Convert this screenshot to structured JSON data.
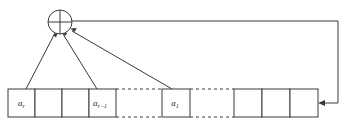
{
  "diagram": {
    "type": "lfsr-schematic",
    "colors": {
      "stroke": "#3a3a3a",
      "fill": "#ffffff",
      "text": "#2a2a2a",
      "background": "#ffffff"
    },
    "xor_gate": {
      "name": "xor-gate",
      "symbol": "⊕",
      "label": "",
      "cx": 60,
      "cy": 22,
      "r": 12,
      "input_count": 3
    },
    "register": {
      "name": "shift-register",
      "top": 89,
      "bottom": 117,
      "left_group": {
        "name": "left-cell-group",
        "x": 8,
        "width": 108,
        "cell_count": 4,
        "cells": [
          {
            "name": "cell-a-r",
            "label_base": "a",
            "label_sub": "r",
            "x": 8,
            "w": 27,
            "has_tap": true
          },
          {
            "name": "cell-blank-1",
            "label_base": "",
            "label_sub": "",
            "x": 35,
            "w": 27,
            "has_tap": false
          },
          {
            "name": "cell-blank-2",
            "label_base": "",
            "label_sub": "",
            "x": 62,
            "w": 27,
            "has_tap": false
          },
          {
            "name": "cell-a-r-minus-1",
            "label_base": "a",
            "label_sub": "r−1",
            "x": 89,
            "w": 27,
            "has_tap": true
          }
        ]
      },
      "middle_group": {
        "name": "middle-cell-group",
        "x": 162,
        "width": 28,
        "cell_count": 1,
        "cells": [
          {
            "name": "cell-a-1",
            "label_base": "a",
            "label_sub": "1",
            "x": 162,
            "w": 28,
            "has_tap": true
          }
        ]
      },
      "right_group": {
        "name": "right-cell-group",
        "x": 234,
        "width": 84,
        "cell_count": 3,
        "cells": [
          {
            "name": "cell-blank-3",
            "label_base": "",
            "label_sub": "",
            "x": 234,
            "w": 28,
            "has_tap": false
          },
          {
            "name": "cell-blank-4",
            "label_base": "",
            "label_sub": "",
            "x": 262,
            "w": 28,
            "has_tap": false
          },
          {
            "name": "cell-blank-5",
            "label_base": "",
            "label_sub": "",
            "x": 290,
            "w": 28,
            "has_tap": false
          }
        ]
      },
      "ellipsis_gaps": [
        {
          "name": "dashed-gap-left",
          "x1": 116,
          "x2": 162
        },
        {
          "name": "dashed-gap-right",
          "x1": 190,
          "x2": 234
        }
      ]
    },
    "taps": [
      {
        "name": "tap-line-a-r",
        "from_x": 26,
        "from_y": 89,
        "to_x": 54,
        "to_y": 32
      },
      {
        "name": "tap-line-a-r-minus-1",
        "from_x": 97,
        "from_y": 89,
        "to_x": 62,
        "to_y": 33
      },
      {
        "name": "tap-line-a-1",
        "from_x": 172,
        "from_y": 89,
        "to_x": 71,
        "to_y": 30
      }
    ],
    "feedback": {
      "name": "feedback-path",
      "start_x": 72,
      "start_y": 21,
      "corner_x": 338,
      "corner_y": 21,
      "end_x": 318,
      "end_y": 103,
      "direction": "right-then-down-then-left"
    }
  }
}
